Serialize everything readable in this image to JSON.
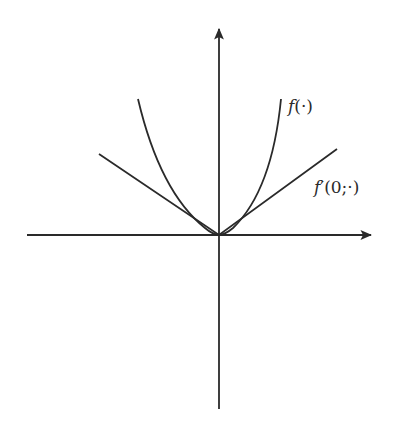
{
  "diagram": {
    "labels": {
      "function": "f(·)",
      "function_name": "f",
      "function_args": "(·)",
      "derivative": "f′(0;·)",
      "derivative_name": "f",
      "derivative_args": "′(0;·)"
    },
    "colors": {
      "stroke": "#2a2a2a",
      "background": "#ffffff"
    },
    "axes": {
      "origin": [
        219,
        235
      ],
      "x_axis": {
        "from": [
          27,
          235
        ],
        "to": [
          372,
          235
        ],
        "arrow": "right"
      },
      "y_axis": {
        "from": [
          219,
          409
        ],
        "to": [
          219,
          28
        ],
        "arrow": "up"
      }
    },
    "curves": {
      "f": {
        "type": "convex-curve",
        "left_end": [
          138,
          99
        ],
        "right_end": [
          281,
          99
        ],
        "vertex": [
          219,
          235
        ]
      },
      "f_prime": {
        "type": "piecewise-linear-cone",
        "left_end": [
          99,
          154
        ],
        "right_end": [
          337,
          149
        ],
        "vertex": [
          219,
          235
        ]
      }
    }
  }
}
